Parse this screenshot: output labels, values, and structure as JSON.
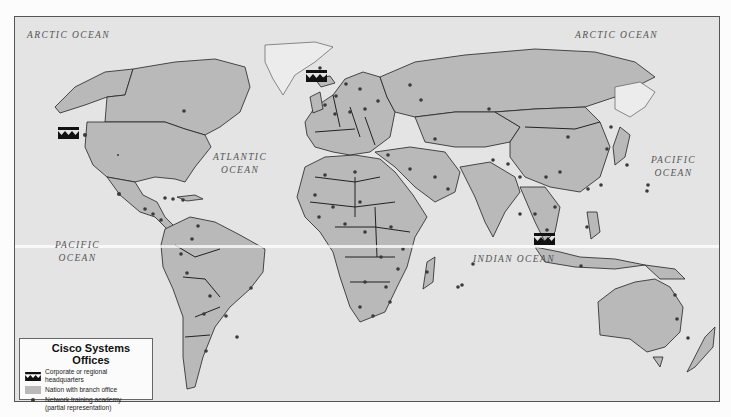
{
  "map": {
    "ocean_labels": [
      {
        "id": "arctic-ocean-west",
        "text": "ARCTIC OCEAN"
      },
      {
        "id": "arctic-ocean-east",
        "text": "ARCTIC OCEAN"
      },
      {
        "id": "atlantic-ocean",
        "line1": "ATLANTIC",
        "line2": "OCEAN"
      },
      {
        "id": "pacific-ocean-west",
        "line1": "PACIFIC",
        "line2": "OCEAN"
      },
      {
        "id": "pacific-ocean-east",
        "line1": "PACIFIC",
        "line2": "OCEAN"
      },
      {
        "id": "indian-ocean",
        "text": "INDIAN OCEAN"
      }
    ],
    "headquarters_markers": [
      {
        "region": "North America (US West Coast)",
        "label": "Cisco Systems"
      },
      {
        "region": "Europe",
        "label": "Cisco Systems"
      },
      {
        "region": "Asia Pacific (Singapore)",
        "label": "Cisco Systems"
      }
    ],
    "colors": {
      "ocean": "#e4e4e4",
      "branch_nation": "#b9b9b9",
      "non_branch_land": "#ececec",
      "academy_dot": "#3a3a3a",
      "hq_icon": "#111111"
    }
  },
  "legend": {
    "title": "Cisco Systems Offices",
    "items": [
      {
        "icon": "cisco-hq-icon",
        "label": "Corporate or regional headquarters"
      },
      {
        "icon": "gray-swatch",
        "label": "Nation with branch office"
      },
      {
        "icon": "dot-icon",
        "label": "Network training academy",
        "label2": "(partial representation)"
      }
    ]
  }
}
